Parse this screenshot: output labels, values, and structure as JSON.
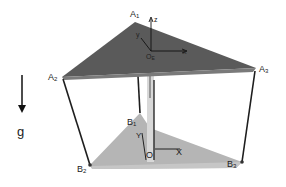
{
  "diagram": {
    "type": "parallel-mechanism-schematic",
    "colors": {
      "top_plate": "#5a5a5a",
      "top_plate_edge": "#7a7a7a",
      "bottom_plate": "#b5b5b5",
      "links": "#1e1e1e",
      "rod": "#d8d8d8"
    },
    "top_points": {
      "A1": {
        "label": "A",
        "sub": "1"
      },
      "A2": {
        "label": "A",
        "sub": "2"
      },
      "A3": {
        "label": "A",
        "sub": "3"
      }
    },
    "bottom_points": {
      "B1": {
        "label": "B",
        "sub": "1"
      },
      "B2": {
        "label": "B",
        "sub": "2"
      },
      "B3": {
        "label": "B",
        "sub": "3"
      }
    },
    "top_frame": {
      "origin": {
        "label": "O",
        "sub": "E"
      },
      "x": "x",
      "y": "y",
      "z": "z"
    },
    "base_frame": {
      "origin": "O",
      "x": "X",
      "y": "Y"
    },
    "gravity": {
      "label": "g"
    }
  }
}
